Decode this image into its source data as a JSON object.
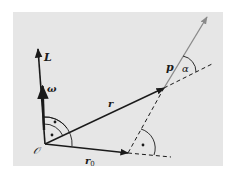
{
  "figure": {
    "background_color": "#e6e6e6",
    "ink_color": "#1a1a1a",
    "p_vector_color": "#8a8a8a",
    "labels": {
      "origin": "𝒪",
      "angular_momentum": "L",
      "angular_velocity": "ω",
      "position": "r",
      "position_perp": "r",
      "position_perp_sub": "0",
      "momentum": "p",
      "angle": "α"
    },
    "right_angle_marker": "•"
  }
}
